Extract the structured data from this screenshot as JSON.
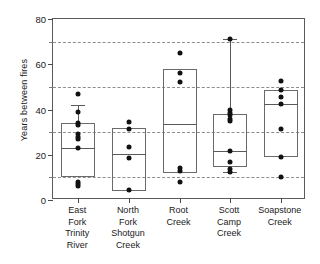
{
  "chart_data": {
    "type": "box",
    "title": "",
    "xlabel": "",
    "ylabel": "Years between fires",
    "ylim": [
      0,
      80
    ],
    "ytick_labels": [
      "0",
      "20",
      "40",
      "60",
      "80"
    ],
    "ytick_values": [
      0,
      20,
      40,
      60,
      80
    ],
    "gridline_values": [
      10,
      30,
      50,
      70
    ],
    "grid": "horizontal-dashed-minor",
    "legend": "none",
    "categories": [
      "East Fork Trinity River",
      "North Fork Shotgun Creek",
      "Root Creek",
      "Scott Camp Creek",
      "Soapstone Creek"
    ],
    "category_label_lines": [
      [
        "East",
        "Fork",
        "Trinity",
        "River"
      ],
      [
        "North",
        "Fork",
        "Shotgun",
        "Creek"
      ],
      [
        "Root",
        "Creek"
      ],
      [
        "Scott",
        "Camp",
        "Creek"
      ],
      [
        "Soapstone",
        "Creek"
      ]
    ],
    "series": [
      {
        "name": "East Fork Trinity River",
        "q1": 10,
        "median": 23,
        "q3": 34,
        "whisker_low": null,
        "whisker_high": 42,
        "points": [
          47,
          39,
          34,
          33,
          29,
          28,
          27,
          23,
          8,
          7,
          6
        ]
      },
      {
        "name": "North Fork Shotgun Creek",
        "q1": 4,
        "median": 20.5,
        "q3": 32,
        "whisker_low": null,
        "whisker_high": null,
        "points": [
          34.5,
          31.5,
          23.5,
          18.5,
          4.5
        ]
      },
      {
        "name": "Root Creek",
        "q1": 12,
        "median": 33.5,
        "q3": 58,
        "whisker_low": null,
        "whisker_high": null,
        "points": [
          65,
          56,
          52,
          14,
          13,
          8
        ]
      },
      {
        "name": "Scott Camp Creek",
        "q1": 14.5,
        "median": 21.5,
        "q3": 38,
        "whisker_low": 12.5,
        "whisker_high": 71,
        "points": [
          71,
          40,
          38.5,
          37.5,
          36,
          35,
          21.5,
          17,
          13.5,
          12.5
        ]
      },
      {
        "name": "Soapstone Creek",
        "q1": 19,
        "median": 42.5,
        "q3": 48.5,
        "whisker_low": null,
        "whisker_high": null,
        "points": [
          52.5,
          48.5,
          45.5,
          42.5,
          31.5,
          19,
          10
        ]
      }
    ]
  },
  "colors": {
    "background": "#ffffff",
    "frame": "#5a5a5a",
    "grid": "#8d8d8d",
    "box_stroke": "#6a6a6a",
    "point": "#111111",
    "text": "#1a1a1a"
  }
}
